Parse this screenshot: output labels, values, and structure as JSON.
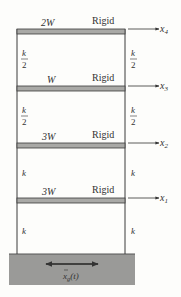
{
  "figure": {
    "type": "shear-building-model",
    "floors": [
      {
        "level": 4,
        "weight": "2W",
        "label": "Rigid",
        "dof": "x",
        "dof_sub": "4"
      },
      {
        "level": 3,
        "weight": "W",
        "label": "Rigid",
        "dof": "x",
        "dof_sub": "3"
      },
      {
        "level": 2,
        "weight": "3W",
        "label": "Rigid",
        "dof": "x",
        "dof_sub": "2"
      },
      {
        "level": 1,
        "weight": "3W",
        "label": "Rigid",
        "dof": "x",
        "dof_sub": "1"
      }
    ],
    "stories": [
      {
        "story": 4,
        "left_k": "k",
        "left_div": "2",
        "right_k": "k",
        "right_div": "2"
      },
      {
        "story": 3,
        "left_k": "k",
        "left_div": "2",
        "right_k": "k",
        "right_div": "2"
      },
      {
        "story": 2,
        "left_k": "k",
        "right_k": "k"
      },
      {
        "story": 1,
        "left_k": "k",
        "right_k": "k"
      }
    ],
    "ground": {
      "excitation": "x",
      "excitation_sub": "g",
      "excitation_arg": "(t)"
    },
    "colors": {
      "slab": "#a9a9a6",
      "ground": "#9a9a98",
      "line": "#3a3a3a",
      "background": "#fdfdfb"
    }
  }
}
